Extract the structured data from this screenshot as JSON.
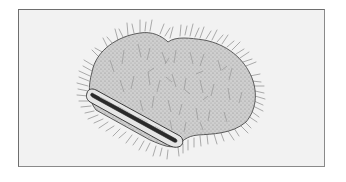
{
  "figure": {
    "parts": [
      "seed-body",
      "hilum",
      "hairs"
    ],
    "colors": {
      "background": "#ffffff",
      "frame_border": "#6e6e6e",
      "frame_fill": "#f2f2f2",
      "body_fill": "#c9c9c9",
      "outline": "#3a3a3a",
      "hair": "#6a6a6a",
      "hilum_dark": "#1e1e1e"
    }
  }
}
